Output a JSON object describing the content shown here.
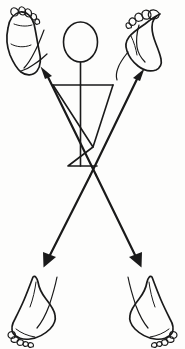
{
  "diagram": {
    "title": "Stick figure with bidirectional diagonal arrows to four feet",
    "caption": "",
    "background_color": "#fdfdfc",
    "ink_color": "#1a1a1a",
    "canvas": {
      "width": 185,
      "height": 349
    },
    "figure": {
      "label": "central-stick-figure",
      "parts": [
        {
          "name": "head",
          "shape": "ellipse",
          "cx": 80.5,
          "cy": 42,
          "rx": 17,
          "ry": 20
        },
        {
          "name": "neck",
          "shape": "line",
          "x1": 80.5,
          "y1": 62,
          "x2": 80.5,
          "y2": 85
        },
        {
          "name": "shoulder-bar",
          "shape": "line",
          "x1": 53,
          "y1": 85,
          "x2": 113,
          "y2": 85
        },
        {
          "name": "torso-inverted-triangle",
          "shape": "polyline",
          "points": "53,85 93,147 113,85"
        },
        {
          "name": "spine-center-line",
          "shape": "line",
          "x1": 80.5,
          "y1": 85,
          "x2": 80.5,
          "y2": 166
        },
        {
          "name": "pelvis-upright-triangle",
          "shape": "polyline",
          "points": "93,147 68,166 97,166"
        }
      ]
    },
    "arrows": [
      {
        "name": "arrow-upper-left",
        "direction": "up-left",
        "from": [
          96,
          175
        ],
        "to": [
          41,
          67
        ],
        "head_at": "tip"
      },
      {
        "name": "arrow-upper-right",
        "direction": "up-right",
        "from": [
          90,
          176
        ],
        "to": [
          144,
          69
        ],
        "head_at": "tip"
      },
      {
        "name": "arrow-lower-left",
        "direction": "down-left",
        "from": [
          90,
          176
        ],
        "to": [
          44,
          264
        ],
        "head_at": "tip"
      },
      {
        "name": "arrow-lower-right",
        "direction": "down-right",
        "from": [
          96,
          175
        ],
        "to": [
          141,
          264
        ],
        "head_at": "tip"
      }
    ],
    "feet": [
      {
        "name": "foot-top-left",
        "position": "top-left",
        "view": "sole (plantar) view, toes upper-left",
        "toe_count": 5
      },
      {
        "name": "foot-top-right",
        "position": "top-right",
        "view": "lateral profile, toes curled upward",
        "toe_count": 5
      },
      {
        "name": "foot-bottom-left",
        "position": "bottom-left",
        "view": "medial profile with ankle, toes lower-left",
        "toe_count": 5
      },
      {
        "name": "foot-bottom-right",
        "position": "bottom-right",
        "view": "lateral profile with ankle, toes lower-right",
        "toe_count": 5
      }
    ]
  }
}
